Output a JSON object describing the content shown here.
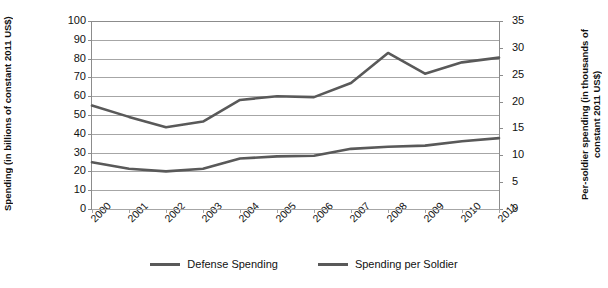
{
  "chart_data": {
    "type": "line",
    "title": "",
    "xlabel": "",
    "categories": [
      "2000",
      "2001",
      "2002",
      "2003",
      "2004",
      "2005",
      "2006",
      "2007",
      "2008",
      "2009",
      "2010",
      "2011"
    ],
    "grid": true,
    "legend_position": "bottom",
    "axes": {
      "left": {
        "label": "Spending (in billions of constant 2011 US$)",
        "ticks": [
          "100",
          "90",
          "80",
          "70",
          "60",
          "50",
          "40",
          "30",
          "20",
          "10",
          "0"
        ],
        "min": 0,
        "max": 100,
        "step": 10
      },
      "right": {
        "label": "Per-soldier spending (in thousands of constant 2011 US$)",
        "ticks": [
          "35",
          "30",
          "25",
          "20",
          "15",
          "10",
          "5",
          "0"
        ],
        "min": 0,
        "max": 35,
        "step": 5
      }
    },
    "series": [
      {
        "name": "Defense Spending",
        "axis": "left",
        "color": "#595959",
        "values": [
          55,
          49,
          43.5,
          46.5,
          58,
          60,
          59.5,
          67,
          83,
          72,
          78,
          80.5
        ]
      },
      {
        "name": "Spending per Soldier",
        "axis": "right",
        "color": "#595959",
        "values": [
          8.7,
          7.5,
          7.0,
          7.5,
          9.4,
          9.8,
          9.9,
          11.2,
          11.6,
          11.8,
          12.6,
          13.2
        ]
      }
    ],
    "series_left_scale_equivalent": [
      {
        "name": "Spending per Soldier (plotted on left-axis pixels)",
        "values": [
          25,
          21.5,
          20,
          21.5,
          27,
          28,
          28.4,
          32,
          33.2,
          33.8,
          36,
          37.7
        ]
      }
    ]
  },
  "legend": {
    "items": [
      {
        "label": "Defense Spending"
      },
      {
        "label": "Spending per Soldier"
      }
    ]
  }
}
